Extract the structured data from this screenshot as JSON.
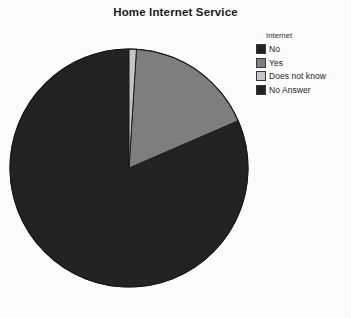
{
  "chart_title": "Home Internet Service",
  "legend": {
    "title": "Internet",
    "items": [
      {
        "label": "No",
        "color": "#232323"
      },
      {
        "label": "Yes",
        "color": "#808080"
      },
      {
        "label": "Does not know",
        "color": "#c8c8c8"
      },
      {
        "label": "No Answer",
        "color": "#232323"
      }
    ]
  },
  "chart_data": {
    "type": "pie",
    "title": "Home Internet Service",
    "legend_title": "Internet",
    "legend_position": "right",
    "categories": [
      "No",
      "Yes",
      "Does not know",
      "No Answer"
    ],
    "values": [
      81.5,
      17.5,
      1.0,
      0.0
    ],
    "units": "percent",
    "colors": [
      "#232323",
      "#808080",
      "#c8c8c8",
      "#232323"
    ],
    "start_angle_deg": 0,
    "direction": "counterclockwise",
    "slice_angles_deg": [
      293.4,
      63.0,
      3.6,
      0.0
    ],
    "annotations": [],
    "grid": false
  },
  "geometry": {
    "center_x": 120,
    "center_y": 121,
    "radius": 119
  }
}
